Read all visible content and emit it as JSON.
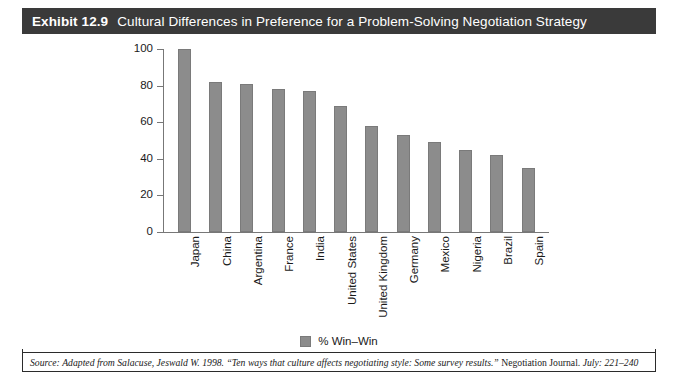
{
  "exhibit": {
    "label": "Exhibit 12.9",
    "title": "Cultural Differences in Preference for a Problem-Solving Negotiation Strategy",
    "title_bar_color": "#3a3a3a",
    "frame_color": "#2b2b2b"
  },
  "legend": {
    "entries": [
      {
        "label": "% Win–Win",
        "color": "#8c8c8c"
      }
    ]
  },
  "source": {
    "prefix": "Source:",
    "part1": "Adapted from Salacuse, Jeswald W. 1998. “Ten ways that culture affects negotiating style: Some survey results.”",
    "journal": "Negotiation Journal.",
    "part2": "July: 221–240"
  },
  "chart_data": {
    "type": "bar",
    "title": "Cultural Differences in Preference for a Problem-Solving Negotiation Strategy",
    "xlabel": "",
    "ylabel": "",
    "ylim": [
      0,
      100
    ],
    "yticks": [
      0,
      20,
      40,
      60,
      80,
      100
    ],
    "grid": false,
    "legend_position": "bottom-center",
    "bar_color": "#8c8c8c",
    "categories": [
      "Japan",
      "China",
      "Argentina",
      "France",
      "India",
      "United States",
      "United Kingdom",
      "Germany",
      "Mexico",
      "Nigeria",
      "Brazil",
      "Spain"
    ],
    "series": [
      {
        "name": "% Win–Win",
        "values": [
          100,
          82,
          81,
          78,
          77,
          69,
          58,
          53,
          49,
          45,
          42,
          35
        ]
      }
    ]
  }
}
